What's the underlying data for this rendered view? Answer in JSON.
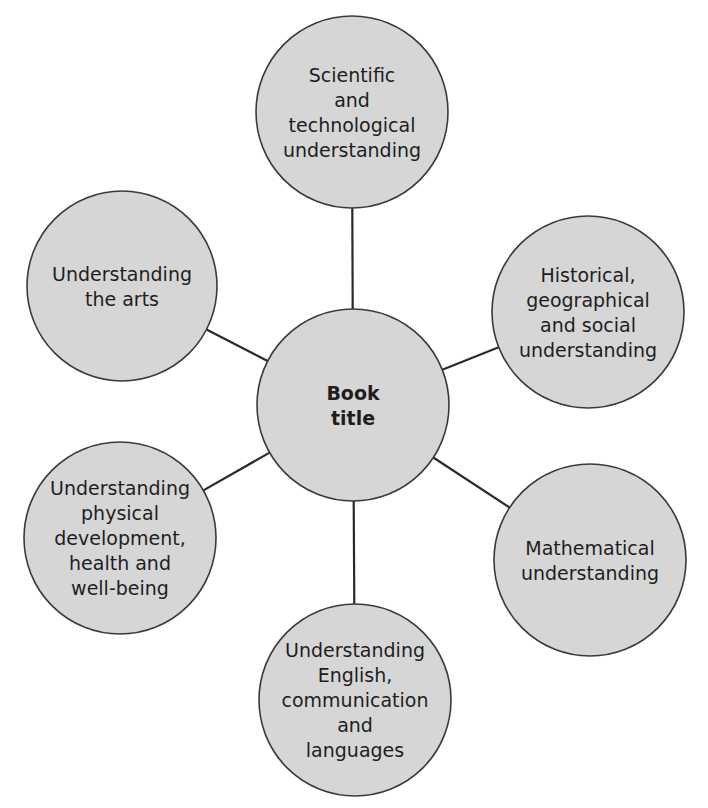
{
  "diagram": {
    "type": "mind-map",
    "center": {
      "id": "book-title",
      "lines": [
        "Book",
        "title"
      ],
      "cx": 353,
      "cy": 405,
      "r": 96,
      "bold": true
    },
    "nodes": [
      {
        "id": "scientific",
        "lines": [
          "Scientific",
          "and",
          "technological",
          "understanding"
        ],
        "cx": 352,
        "cy": 112,
        "r": 96
      },
      {
        "id": "historical",
        "lines": [
          "Historical,",
          "geographical",
          "and social",
          "understanding"
        ],
        "cx": 588,
        "cy": 312,
        "r": 96
      },
      {
        "id": "mathematical",
        "lines": [
          "Mathematical",
          "understanding"
        ],
        "cx": 590,
        "cy": 560,
        "r": 96
      },
      {
        "id": "english",
        "lines": [
          "Understanding",
          "English,",
          "communication",
          "and",
          "languages"
        ],
        "cx": 355,
        "cy": 700,
        "r": 96
      },
      {
        "id": "physical",
        "lines": [
          "Understanding",
          "physical",
          "development,",
          "health and",
          "well-being"
        ],
        "cx": 120,
        "cy": 538,
        "r": 96
      },
      {
        "id": "arts",
        "lines": [
          "Understanding",
          "the arts"
        ],
        "cx": 122,
        "cy": 286,
        "r": 95
      }
    ],
    "colors": {
      "node_fill": "#d6d6d6",
      "node_stroke": "#3a3a3a",
      "connector": "#2a2a2a",
      "text": "#1e1e1e",
      "background": "#ffffff"
    }
  }
}
